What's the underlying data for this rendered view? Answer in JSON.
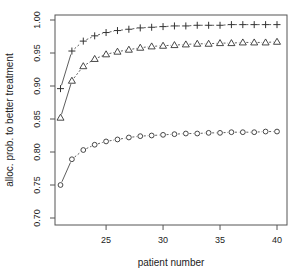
{
  "chart_data": {
    "type": "line",
    "title": "",
    "xlabel": "patient number",
    "ylabel": "alloc. prob. to better treatment",
    "xlim": [
      20.5,
      40.8
    ],
    "ylim": [
      0.69,
      1.008
    ],
    "xticks": [
      25,
      30,
      35,
      40
    ],
    "yticks": [
      0.7,
      0.75,
      0.8,
      0.85,
      0.9,
      0.95,
      1.0
    ],
    "ytick_labels": [
      "0.70",
      "0.75",
      "0.80",
      "0.85",
      "0.90",
      "0.95",
      "1.00"
    ],
    "grid": false,
    "legend": null,
    "x": [
      21,
      22,
      23,
      24,
      25,
      26,
      27,
      28,
      29,
      30,
      31,
      32,
      33,
      34,
      35,
      36,
      37,
      38,
      39,
      40
    ],
    "series": [
      {
        "name": "plus",
        "marker": "+",
        "values": [
          0.896,
          0.953,
          0.968,
          0.976,
          0.981,
          0.984,
          0.986,
          0.988,
          0.989,
          0.99,
          0.991,
          0.991,
          0.992,
          0.992,
          0.992,
          0.993,
          0.993,
          0.993,
          0.993,
          0.993
        ]
      },
      {
        "name": "triangle",
        "marker": "triangle",
        "values": [
          0.852,
          0.908,
          0.93,
          0.941,
          0.948,
          0.952,
          0.955,
          0.958,
          0.96,
          0.961,
          0.962,
          0.963,
          0.964,
          0.964,
          0.965,
          0.965,
          0.966,
          0.966,
          0.966,
          0.967
        ]
      },
      {
        "name": "circle",
        "marker": "circle",
        "values": [
          0.75,
          0.789,
          0.803,
          0.811,
          0.816,
          0.819,
          0.822,
          0.824,
          0.825,
          0.826,
          0.827,
          0.828,
          0.828,
          0.829,
          0.829,
          0.83,
          0.83,
          0.83,
          0.831,
          0.831
        ]
      }
    ]
  },
  "colors": {
    "line": "#333333",
    "axis": "#444444"
  }
}
